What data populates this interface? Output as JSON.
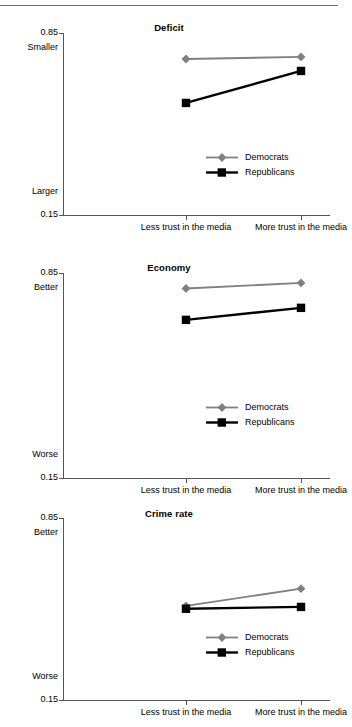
{
  "figure": {
    "has_top_rule": true,
    "x_categories": [
      "Less trust in the media",
      "More trust in the media"
    ],
    "y_axis_min_label": "0.15",
    "y_axis_max_label": "0.85",
    "legend_entries": [
      "Democrats",
      "Republicans"
    ],
    "colors": {
      "democrats": "#808080",
      "republicans": "#000000",
      "axis": "#555555",
      "background": "#ffffff"
    }
  },
  "chart_data": [
    {
      "type": "line",
      "title": "Deficit",
      "xlabel": "",
      "ylabel": "",
      "categories": [
        "Less trust in the media",
        "More trust in the media"
      ],
      "ylim": [
        0.15,
        0.85
      ],
      "ytick_labels": [
        "0.15",
        "0.85"
      ],
      "y_top_word": "Smaller",
      "y_bottom_word": "Larger",
      "grid": false,
      "legend_position": "lower right",
      "series": [
        {
          "name": "Democrats",
          "color": "#808080",
          "marker": "diamond",
          "values": [
            0.75,
            0.758
          ]
        },
        {
          "name": "Republicans",
          "color": "#000000",
          "marker": "square",
          "values": [
            0.581,
            0.704
          ]
        }
      ]
    },
    {
      "type": "line",
      "title": "Economy",
      "xlabel": "",
      "ylabel": "",
      "categories": [
        "Less trust in the media",
        "More trust in the media"
      ],
      "ylim": [
        0.15,
        0.85
      ],
      "ytick_labels": [
        "0.15",
        "0.85"
      ],
      "y_top_word": "Better",
      "y_bottom_word": "Worse",
      "grid": false,
      "legend_position": "lower right",
      "series": [
        {
          "name": "Democrats",
          "color": "#808080",
          "marker": "diamond",
          "values": [
            0.797,
            0.816
          ]
        },
        {
          "name": "Republicans",
          "color": "#000000",
          "marker": "square",
          "values": [
            0.69,
            0.731
          ]
        }
      ]
    },
    {
      "type": "line",
      "title": "Crime rate",
      "xlabel": "",
      "ylabel": "",
      "categories": [
        "Less trust in the media",
        "More trust in the media"
      ],
      "ylim": [
        0.15,
        0.85
      ],
      "ytick_labels": [
        "0.15",
        "0.85"
      ],
      "y_top_word": "Better",
      "y_bottom_word": "Worse",
      "grid": false,
      "legend_position": "lower right",
      "series": [
        {
          "name": "Democrats",
          "color": "#808080",
          "marker": "diamond",
          "values": [
            0.512,
            0.578
          ]
        },
        {
          "name": "Republicans",
          "color": "#000000",
          "marker": "square",
          "values": [
            0.501,
            0.508
          ]
        }
      ]
    }
  ]
}
